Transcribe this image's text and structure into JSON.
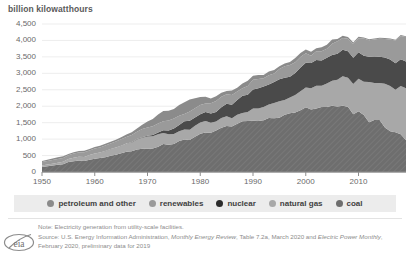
{
  "chart_data": {
    "type": "area",
    "title": "billion kilowatthours",
    "ylabel": "billion kilowatthours",
    "xlabel": "",
    "ylim": [
      0,
      4500
    ],
    "xlim": [
      1950,
      2019
    ],
    "grid": true,
    "stacked": true,
    "legend_position": "bottom",
    "ytick_labels": [
      "0",
      "500",
      "1,000",
      "1,500",
      "2,000",
      "2,500",
      "3,000",
      "3,500",
      "4,000",
      "4,500"
    ],
    "ytick_values": [
      0,
      500,
      1000,
      1500,
      2000,
      2500,
      3000,
      3500,
      4000,
      4500
    ],
    "xtick_labels": [
      "1950",
      "1960",
      "1970",
      "1980",
      "1990",
      "2000",
      "2010"
    ],
    "xtick_values": [
      1950,
      1960,
      1970,
      1980,
      1990,
      2000,
      2010
    ],
    "x": [
      1950,
      1951,
      1952,
      1953,
      1954,
      1955,
      1956,
      1957,
      1958,
      1959,
      1960,
      1961,
      1962,
      1963,
      1964,
      1965,
      1966,
      1967,
      1968,
      1969,
      1970,
      1971,
      1972,
      1973,
      1974,
      1975,
      1976,
      1977,
      1978,
      1979,
      1980,
      1981,
      1982,
      1983,
      1984,
      1985,
      1986,
      1987,
      1988,
      1989,
      1990,
      1991,
      1992,
      1993,
      1994,
      1995,
      1996,
      1997,
      1998,
      1999,
      2000,
      2001,
      2002,
      2003,
      2004,
      2005,
      2006,
      2007,
      2008,
      2009,
      2010,
      2011,
      2012,
      2013,
      2014,
      2015,
      2016,
      2017,
      2018,
      2019
    ],
    "series": [
      {
        "name": "coal",
        "color": "#6e6e6e",
        "values": [
          155,
          175,
          195,
          218,
          239,
          301,
          330,
          346,
          334,
          374,
          403,
          422,
          450,
          494,
          527,
          571,
          613,
          630,
          684,
          706,
          704,
          713,
          771,
          848,
          828,
          853,
          944,
          985,
          976,
          1075,
          1162,
          1203,
          1192,
          1259,
          1342,
          1402,
          1386,
          1464,
          1541,
          1554,
          1560,
          1551,
          1576,
          1639,
          1635,
          1653,
          1737,
          1788,
          1807,
          1881,
          1966,
          1904,
          1933,
          1974,
          1978,
          2013,
          1991,
          2016,
          1986,
          1756,
          1847,
          1733,
          1514,
          1581,
          1582,
          1352,
          1239,
          1206,
          1150,
          966
        ]
      },
      {
        "name": "natural gas",
        "color": "#a8a8a8",
        "values": [
          45,
          51,
          57,
          65,
          75,
          95,
          107,
          115,
          120,
          140,
          158,
          169,
          183,
          200,
          216,
          222,
          250,
          263,
          305,
          333,
          373,
          374,
          376,
          341,
          320,
          300,
          295,
          306,
          305,
          329,
          346,
          346,
          305,
          274,
          297,
          292,
          248,
          273,
          253,
          267,
          373,
          381,
          404,
          415,
          460,
          496,
          455,
          479,
          531,
          571,
          601,
          639,
          691,
          650,
          710,
          761,
          816,
          897,
          883,
          921,
          988,
          1013,
          1225,
          1124,
          1126,
          1333,
          1379,
          1296,
          1468,
          1582
        ]
      },
      {
        "name": "nuclear",
        "color": "#4a4a4a",
        "values": [
          0,
          0,
          0,
          0,
          0,
          0,
          0,
          0,
          0,
          0,
          1,
          2,
          2,
          3,
          3,
          4,
          6,
          8,
          13,
          14,
          22,
          38,
          54,
          83,
          114,
          173,
          191,
          251,
          276,
          255,
          251,
          273,
          283,
          294,
          328,
          384,
          414,
          455,
          527,
          529,
          577,
          613,
          619,
          610,
          640,
          673,
          675,
          629,
          674,
          728,
          754,
          769,
          780,
          764,
          789,
          782,
          787,
          806,
          806,
          799,
          807,
          790,
          769,
          789,
          797,
          797,
          806,
          805,
          807,
          809
        ]
      },
      {
        "name": "renewables",
        "color": "#9a9a9a",
        "values": [
          101,
          111,
          116,
          115,
          114,
          117,
          125,
          134,
          147,
          140,
          149,
          153,
          173,
          170,
          178,
          197,
          195,
          222,
          222,
          253,
          251,
          266,
          273,
          272,
          303,
          300,
          284,
          220,
          280,
          280,
          279,
          261,
          309,
          332,
          321,
          285,
          293,
          253,
          223,
          266,
          293,
          282,
          253,
          280,
          260,
          310,
          348,
          357,
          323,
          320,
          288,
          222,
          267,
          282,
          270,
          342,
          385,
          352,
          378,
          419,
          427,
          520,
          498,
          535,
          545,
          561,
          608,
          689,
          713,
          749
        ]
      },
      {
        "name": "petroleum and other",
        "color": "#8b8b8b",
        "values": [
          33,
          39,
          46,
          51,
          50,
          37,
          40,
          43,
          42,
          48,
          48,
          49,
          51,
          54,
          59,
          65,
          75,
          83,
          100,
          131,
          184,
          220,
          274,
          314,
          301,
          289,
          320,
          358,
          365,
          304,
          246,
          206,
          147,
          144,
          120,
          100,
          137,
          118,
          149,
          158,
          127,
          119,
          101,
          115,
          105,
          81,
          82,
          93,
          129,
          119,
          112,
          126,
          95,
          120,
          121,
          127,
          68,
          72,
          51,
          45,
          45,
          34,
          28,
          30,
          34,
          32,
          29,
          27,
          29,
          23
        ]
      }
    ],
    "notes": [
      "Note: Electricity generation from utility-scale facilities.",
      "Source: U.S. Energy Information Administration, Monthly Energy Review, Table 7.2a, March 2020 and Electric Power Monthly, February 2020, preliminary data for 2019"
    ]
  },
  "header": {
    "axis_title": "billion kilowatthours"
  },
  "legend": {
    "items": [
      {
        "label": "petroleum and other",
        "color": "#8b8b8b"
      },
      {
        "label": "renewables",
        "color": "#9a9a9a"
      },
      {
        "label": "nuclear",
        "color": "#2b2b2b"
      },
      {
        "label": "natural gas",
        "color": "#a8a8a8"
      },
      {
        "label": "coal",
        "color": "#6e6e6e"
      }
    ]
  },
  "footer": {
    "note_line": "Note: Electricity generation from utility-scale facilities.",
    "source_prefix": "Source: U.S. Energy Information Administration, ",
    "source_italic1": "Monthly Energy Review",
    "source_mid": ", Table 7.2a, March 2020 and ",
    "source_italic2": "Electric Power Monthly",
    "source_suffix": ", February 2020, preliminary data for 2019"
  },
  "logo": {
    "text": "eia"
  }
}
